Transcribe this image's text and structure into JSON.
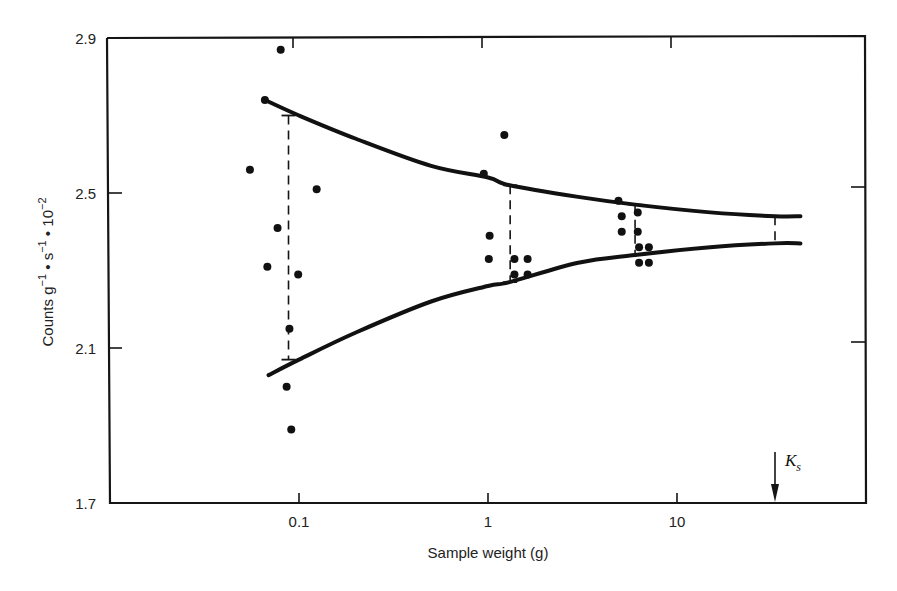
{
  "chart_data": {
    "type": "scatter",
    "title": "",
    "xlabel": "Sample weight (g)",
    "ylabel": "Counts g⁻¹ • s⁻¹ • 10⁻²",
    "ylabel_parts": {
      "base": "Counts g",
      "sup1": "−1",
      "mid": " • s",
      "sup2": "−1",
      "mid2": " • 10",
      "sup3": "−2"
    },
    "x_scale": "log",
    "xlim": [
      0.011,
      115
    ],
    "ylim": [
      1.7,
      2.9
    ],
    "x_ticks": [
      {
        "value": 0.1,
        "label": "0.1"
      },
      {
        "value": 1,
        "label": "1"
      },
      {
        "value": 10,
        "label": "10"
      }
    ],
    "y_ticks": [
      {
        "value": 2.9,
        "label": "2.9"
      },
      {
        "value": 2.5,
        "label": "2.5"
      },
      {
        "value": 2.1,
        "label": "2.1"
      },
      {
        "value": 1.7,
        "label": "1.7"
      }
    ],
    "grid": false,
    "legend": null,
    "series": [
      {
        "name": "Measurements",
        "kind": "points",
        "points": [
          {
            "x": 0.08,
            "y": 2.87
          },
          {
            "x": 0.066,
            "y": 2.74
          },
          {
            "x": 0.055,
            "y": 2.56
          },
          {
            "x": 0.124,
            "y": 2.51
          },
          {
            "x": 0.077,
            "y": 2.41
          },
          {
            "x": 0.068,
            "y": 2.31
          },
          {
            "x": 0.099,
            "y": 2.29
          },
          {
            "x": 0.089,
            "y": 2.15
          },
          {
            "x": 0.086,
            "y": 2.0
          },
          {
            "x": 0.091,
            "y": 1.89
          },
          {
            "x": 1.22,
            "y": 2.65
          },
          {
            "x": 0.95,
            "y": 2.55
          },
          {
            "x": 1.02,
            "y": 2.39
          },
          {
            "x": 1.01,
            "y": 2.33
          },
          {
            "x": 1.38,
            "y": 2.33
          },
          {
            "x": 1.62,
            "y": 2.33
          },
          {
            "x": 1.38,
            "y": 2.29
          },
          {
            "x": 1.62,
            "y": 2.29
          },
          {
            "x": 4.9,
            "y": 2.48
          },
          {
            "x": 5.1,
            "y": 2.44
          },
          {
            "x": 6.2,
            "y": 2.45
          },
          {
            "x": 5.1,
            "y": 2.4
          },
          {
            "x": 6.2,
            "y": 2.4
          },
          {
            "x": 6.3,
            "y": 2.36
          },
          {
            "x": 7.1,
            "y": 2.36
          },
          {
            "x": 6.3,
            "y": 2.32
          },
          {
            "x": 7.1,
            "y": 2.32
          }
        ]
      },
      {
        "name": "Upper envelope",
        "kind": "curve",
        "points": [
          {
            "x": 0.066,
            "y": 2.74
          },
          {
            "x": 0.1,
            "y": 2.7
          },
          {
            "x": 0.2,
            "y": 2.64
          },
          {
            "x": 0.5,
            "y": 2.57
          },
          {
            "x": 1.0,
            "y": 2.54
          },
          {
            "x": 1.3,
            "y": 2.52
          },
          {
            "x": 3.0,
            "y": 2.49
          },
          {
            "x": 6.0,
            "y": 2.47
          },
          {
            "x": 15,
            "y": 2.45
          },
          {
            "x": 33,
            "y": 2.44
          },
          {
            "x": 45,
            "y": 2.44
          }
        ]
      },
      {
        "name": "Lower envelope",
        "kind": "curve",
        "points": [
          {
            "x": 0.069,
            "y": 2.03
          },
          {
            "x": 0.1,
            "y": 2.07
          },
          {
            "x": 0.2,
            "y": 2.14
          },
          {
            "x": 0.5,
            "y": 2.22
          },
          {
            "x": 1.0,
            "y": 2.26
          },
          {
            "x": 1.3,
            "y": 2.27
          },
          {
            "x": 3.0,
            "y": 2.32
          },
          {
            "x": 6.0,
            "y": 2.34
          },
          {
            "x": 15,
            "y": 2.36
          },
          {
            "x": 33,
            "y": 2.37
          },
          {
            "x": 45,
            "y": 2.37
          }
        ]
      }
    ],
    "error_bars": [
      {
        "x": 0.088,
        "y_low": 2.07,
        "y_high": 2.7
      },
      {
        "x": 1.31,
        "y_low": 2.27,
        "y_high": 2.52
      },
      {
        "x": 6.0,
        "y_low": 2.34,
        "y_high": 2.47
      },
      {
        "x": 33,
        "y_low": 2.37,
        "y_high": 2.44
      }
    ],
    "annotations": [
      {
        "text": "K",
        "subscript": "s",
        "x": 33,
        "type": "arrow-down-to-x-axis"
      }
    ]
  }
}
